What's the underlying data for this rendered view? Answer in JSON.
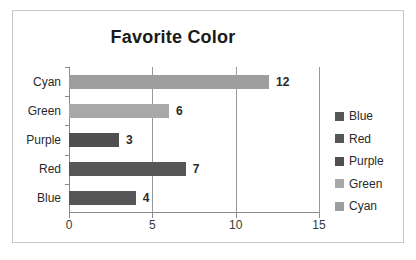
{
  "chart_data": {
    "type": "bar",
    "orientation": "horizontal",
    "title": "Favorite Color",
    "xlabel": "",
    "ylabel": "",
    "categories": [
      "Cyan",
      "Green",
      "Purple",
      "Red",
      "Blue"
    ],
    "values": [
      12,
      6,
      3,
      7,
      4
    ],
    "data_labels": [
      "12",
      "6",
      "3",
      "7",
      "4"
    ],
    "xlim": [
      0,
      15
    ],
    "xticks": [
      0,
      5,
      10,
      15
    ],
    "xtick_labels": [
      "0",
      "5",
      "10",
      "15"
    ],
    "grid": "vertical",
    "legend_position": "right",
    "legend": [
      {
        "label": "Blue",
        "color": "#565656"
      },
      {
        "label": "Red",
        "color": "#565656"
      },
      {
        "label": "Purple",
        "color": "#4f4f4f"
      },
      {
        "label": "Green",
        "color": "#a8a8a8"
      },
      {
        "label": "Cyan",
        "color": "#9e9e9e"
      }
    ],
    "bar_colors": [
      "#9e9e9e",
      "#a8a8a8",
      "#4f4f4f",
      "#565656",
      "#565656"
    ],
    "colors": {
      "background": "#ffffff",
      "frame_border": "#c9c9c9",
      "axis": "#8a8a8a",
      "gridline": "#9a9a9a",
      "title_text": "#1a1a1a",
      "label_text": "#2a2a2a"
    }
  }
}
